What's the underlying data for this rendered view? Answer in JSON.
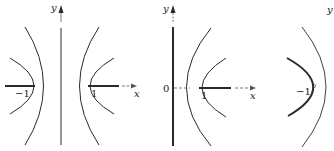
{
  "panels": [
    {
      "id": "left",
      "y_label": "y",
      "x_label": "x",
      "cut_left_label": "−1",
      "cut_right_label": "1"
    },
    {
      "id": "middle",
      "y_label": "y",
      "x_label": "x",
      "origin_label": "0",
      "cut_label": "1"
    },
    {
      "id": "right",
      "y_label": "y",
      "cut_label": "−1",
      "point_marker": "°"
    }
  ],
  "colors": {
    "stroke": "#2a2a2a",
    "axis": "#555555",
    "background": "#ffffff"
  }
}
